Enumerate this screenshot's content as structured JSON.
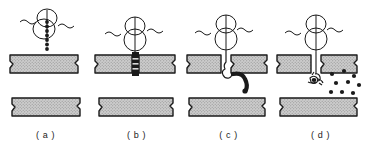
{
  "figure": {
    "type": "schematic-sequence",
    "panel_count": 4,
    "width": 366,
    "height": 146,
    "background_color": "#ffffff",
    "ink_color": "#1a1a1a",
    "bar_fill_color": "#c9c9c9",
    "bar_stroke_color": "#1a1a1a",
    "dark_segment_color": "#1a1a1a"
  },
  "panels": [
    {
      "id": "a",
      "label": "( a )",
      "x": 0,
      "description": "Cell body above intact upper bar; bead chain held inside the cell, not yet penetrating.",
      "cell": {
        "present": true,
        "lobes": 2
      },
      "membrane_wave": {
        "present": true
      },
      "upper_bar": {
        "state": "intact",
        "gap": false,
        "dark_segment": false
      },
      "lower_bar": {
        "state": "intact"
      },
      "bead_chain": {
        "present": true,
        "orientation": "vertical",
        "beads": 7,
        "location": "inside-cell"
      },
      "free_particles": {
        "present": false,
        "count": 0
      }
    },
    {
      "id": "b",
      "label": "( b )",
      "x": 91,
      "description": "Cell attached to upper bar; a dark segment marks the penetration site within the bar.",
      "cell": {
        "present": true,
        "lobes": 2
      },
      "membrane_wave": {
        "present": true
      },
      "upper_bar": {
        "state": "penetrated",
        "gap": false,
        "dark_segment": true
      },
      "lower_bar": {
        "state": "intact"
      },
      "bead_chain": {
        "present": true,
        "orientation": "vertical",
        "beads": 4,
        "location": "within-bar"
      },
      "free_particles": {
        "present": false,
        "count": 0
      }
    },
    {
      "id": "c",
      "label": "( c )",
      "x": 183,
      "description": "Upper bar is split open; a thick chain emerges below the gap and curves to the right.",
      "cell": {
        "present": true,
        "lobes": 2
      },
      "membrane_wave": {
        "present": true
      },
      "upper_bar": {
        "state": "split",
        "gap": true,
        "dark_segment": false
      },
      "lower_bar": {
        "state": "intact"
      },
      "bead_chain": {
        "present": true,
        "orientation": "curved",
        "beads": 1,
        "location": "below-gap"
      },
      "free_particles": {
        "present": false,
        "count": 0
      }
    },
    {
      "id": "d",
      "label": "( d )",
      "x": 275,
      "description": "Chain has fragmented into a cluster plus scattered particles dispersing toward the lower bar.",
      "cell": {
        "present": true,
        "lobes": 2
      },
      "membrane_wave": {
        "present": true
      },
      "upper_bar": {
        "state": "split",
        "gap": true,
        "dark_segment": false
      },
      "lower_bar": {
        "state": "intact"
      },
      "bead_chain": {
        "present": false,
        "orientation": "fragmented",
        "beads": 0,
        "location": "below-gap"
      },
      "free_particles": {
        "present": true,
        "count": 9
      }
    }
  ]
}
